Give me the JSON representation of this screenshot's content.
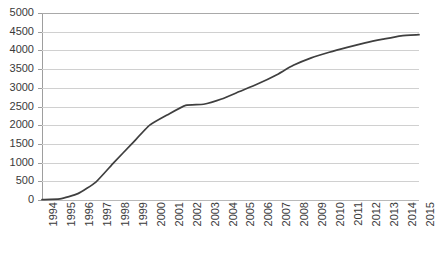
{
  "chart_data": {
    "type": "line",
    "title": "",
    "subtitle": "",
    "xlabel": "",
    "ylabel": "",
    "categories": [
      "1994",
      "1995",
      "1996",
      "1997",
      "1998",
      "1999",
      "2000",
      "2001",
      "2002",
      "2003",
      "2004",
      "2005",
      "2006",
      "2007",
      "2008",
      "2009",
      "2010",
      "2011",
      "2012",
      "2013",
      "2014",
      "2015"
    ],
    "series": [
      {
        "name": "Cumulative total",
        "values": [
          10,
          30,
          170,
          480,
          1000,
          1500,
          2000,
          2280,
          2530,
          2560,
          2700,
          2900,
          3100,
          3330,
          3600,
          3800,
          3950,
          4080,
          4200,
          4300,
          4390,
          4420
        ]
      }
    ],
    "y_ticks": [
      0,
      500,
      1000,
      1500,
      2000,
      2500,
      3000,
      3500,
      4000,
      4500,
      5000
    ],
    "ylim": [
      0,
      5000
    ],
    "xlim_categories": [
      "1994",
      "2015"
    ],
    "grid": true,
    "grid_axis": "y",
    "legend": false,
    "legend_position": "none",
    "markers": false,
    "line_color": "#3f3f3f",
    "line_width": 1.7,
    "grid_color": "#d0d0d0",
    "axis_color": "#9e9e9e",
    "text_color": "#3a3a3a",
    "background_color": "#ffffff",
    "x_label_rotation": -90
  }
}
